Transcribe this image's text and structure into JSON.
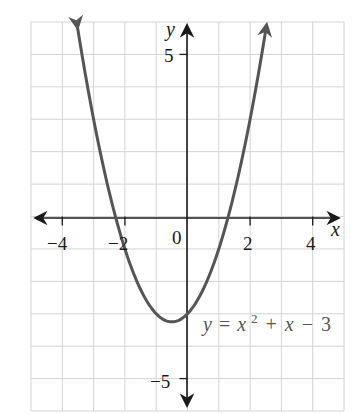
{
  "chart_data": {
    "type": "line",
    "title": "",
    "function": "y = x^2 + x - 3",
    "equation_label": {
      "y": "y",
      "eq": "=",
      "x1": "x",
      "exp": "2",
      "plus": "+",
      "x2": "x",
      "minus": "−",
      "const": "3"
    },
    "xlabel": "x",
    "ylabel": "y",
    "xlim": [
      -5,
      5
    ],
    "ylim": [
      -6,
      6
    ],
    "grid": true,
    "x_ticks": [
      -4,
      -2,
      2,
      4
    ],
    "x_tick_labels": [
      "−4",
      "−2",
      "2",
      "4"
    ],
    "y_ticks": [
      5,
      -5
    ],
    "y_tick_labels": [
      "5",
      "−5"
    ],
    "origin_label": "0",
    "key_points": {
      "vertex": [
        -0.5,
        -3.25
      ],
      "y_intercept": [
        0,
        -3
      ],
      "x_intercepts": [
        -2.303,
        1.303
      ]
    },
    "x": [
      -3.5,
      -3,
      -2.5,
      -2,
      -1.5,
      -1,
      -0.5,
      0,
      0.5,
      1,
      1.5,
      2,
      2.5
    ],
    "values": [
      5.75,
      3,
      0.75,
      -1,
      -2.25,
      -3,
      -3.25,
      -3,
      -2.25,
      -1,
      0.75,
      3,
      5.75
    ],
    "colors": {
      "curve": "#555555",
      "axes": "#1a1a1a",
      "grid": "#d4d4d4"
    }
  }
}
